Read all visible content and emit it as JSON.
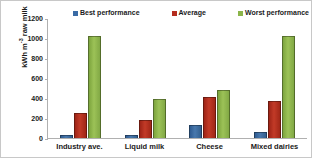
{
  "chart_data": {
    "type": "bar",
    "title": "",
    "xlabel": "",
    "ylabel": "kWh m-3 raw milk",
    "ylabel_base": "kWh m",
    "ylabel_exponent": "-3",
    "ylabel_tail": " raw milk",
    "categories": [
      "Industry ave.",
      "Liquid milk",
      "Cheese",
      "Mixed dairies"
    ],
    "series": [
      {
        "name": "Best performance",
        "color": "#3a6bA5",
        "values": [
          30,
          30,
          130,
          60
        ]
      },
      {
        "name": "Average",
        "color": "#b52c1e",
        "values": [
          250,
          180,
          410,
          375
        ]
      },
      {
        "name": "Worst performance",
        "color": "#8bb54a",
        "values": [
          1025,
          390,
          485,
          1025
        ]
      }
    ],
    "ylim": [
      0,
      1200
    ],
    "yticks": [
      1200,
      1000,
      800,
      600,
      400,
      200,
      0
    ],
    "ytick_labels": [
      "1200",
      "1000",
      "800",
      "600",
      "400",
      "200",
      "0"
    ],
    "grid": false,
    "legend_position": "top"
  },
  "legend": {
    "entries": [
      {
        "label": "Best performance"
      },
      {
        "label": "Average"
      },
      {
        "label": "Worst performance"
      }
    ]
  }
}
